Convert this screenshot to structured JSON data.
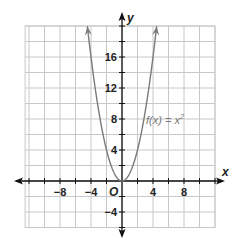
{
  "chart_data": {
    "type": "line",
    "title": "",
    "xlabel": "x",
    "ylabel": "y",
    "xlim": [
      -12.5,
      12
    ],
    "ylim": [
      -6,
      20
    ],
    "grid": true,
    "grid_step": 2,
    "x_ticks": [
      -8,
      -4,
      4,
      8
    ],
    "x_tick_labels": [
      "−8",
      "−4",
      "4",
      "8"
    ],
    "y_ticks": [
      16,
      12,
      8,
      4,
      -4
    ],
    "y_tick_labels": [
      "16",
      "12",
      "8",
      "4",
      "−4"
    ],
    "origin_label": "O",
    "series": [
      {
        "name": "f(x) = x²",
        "function": "x^2",
        "x": [
          -4.47,
          -4,
          -3,
          -2,
          -1,
          0,
          1,
          2,
          3,
          4,
          4.47
        ],
        "values": [
          20,
          16,
          9,
          4,
          1,
          0,
          1,
          4,
          9,
          16,
          20
        ],
        "arrows_at_ends": true
      }
    ],
    "annotations": [
      {
        "text": "f(x) = x²",
        "x": 5,
        "y": 8
      }
    ]
  },
  "colors": {
    "grid": "#c8c8c8",
    "axis": "#111111",
    "curve": "#7a7a7a",
    "label": "#222222",
    "annotation": "#777777"
  },
  "labels": {
    "x_axis": "x",
    "y_axis": "y",
    "origin": "O",
    "fn_prefix": "f(x) = x",
    "fn_exp": "2"
  }
}
